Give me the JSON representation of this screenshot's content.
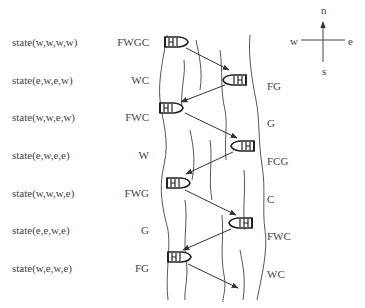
{
  "rows": [
    {
      "state": "state(w,w,w,w)",
      "west_bank": "FWGC",
      "east_bank": "",
      "boat_side": "west",
      "y": 42
    },
    {
      "state": "state(e,w,e,w)",
      "west_bank": "WC",
      "east_bank": "FG",
      "boat_side": "east",
      "y": 80
    },
    {
      "state": "state(w,w,e,w)",
      "west_bank": "FWC",
      "east_bank": "G",
      "boat_side": "west",
      "y": 117
    },
    {
      "state": "state(e,w,e,e)",
      "west_bank": "W",
      "east_bank": "FCG",
      "boat_side": "east",
      "y": 155
    },
    {
      "state": "state(w,w,w,e)",
      "west_bank": "FWG",
      "east_bank": "C",
      "boat_side": "west",
      "y": 193
    },
    {
      "state": "state(e,e,w,e)",
      "west_bank": "G",
      "east_bank": "FWC",
      "boat_side": "east",
      "y": 230
    },
    {
      "state": "state(w,e,w,e)",
      "west_bank": "FG",
      "east_bank": "WC",
      "boat_side": "west",
      "y": 268
    }
  ],
  "compass": {
    "north": "n",
    "south": "s",
    "west": "w",
    "east": "e"
  },
  "icons": {
    "boat": "boat-icon",
    "arrow": "crossing-arrow",
    "compass": "compass-rose-icon"
  }
}
